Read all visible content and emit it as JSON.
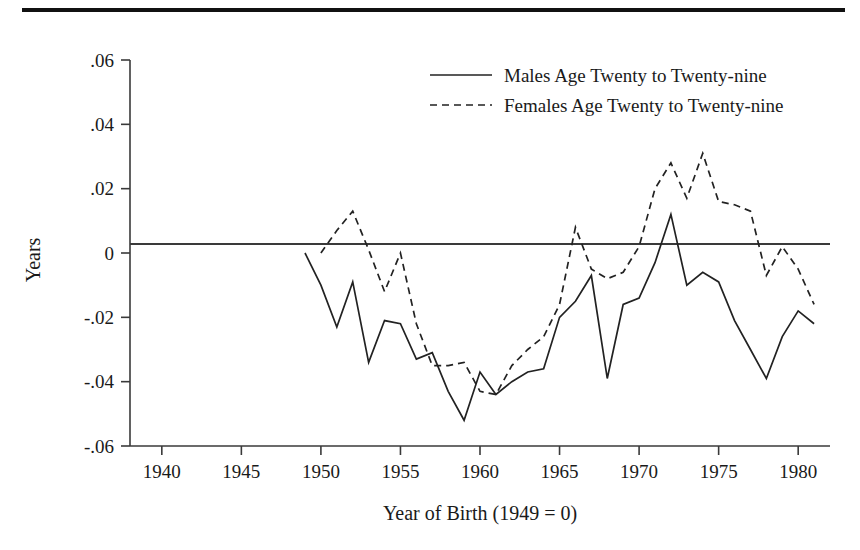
{
  "figure": {
    "rule_present": true,
    "ylabel": "Years",
    "xlabel": "Year of Birth (1949 = 0)"
  },
  "legend": {
    "entries": [
      {
        "label": "Males Age Twenty to Twenty-nine",
        "style": "solid"
      },
      {
        "label": "Females Age Twenty to Twenty-nine",
        "style": "dashed"
      }
    ]
  },
  "axes": {
    "y_ticks": [
      ".06",
      ".04",
      ".02",
      "0",
      "-.02",
      "-.04",
      "-.06"
    ],
    "x_ticks": [
      "1940",
      "1945",
      "1950",
      "1955",
      "1960",
      "1965",
      "1970",
      "1975",
      "1980"
    ]
  },
  "chart_data": {
    "type": "line",
    "title": "",
    "xlabel": "Year of Birth (1949 = 0)",
    "ylabel": "Years",
    "xlim": [
      1938,
      1982
    ],
    "ylim": [
      -0.06,
      0.06
    ],
    "xticks": [
      1940,
      1945,
      1950,
      1955,
      1960,
      1965,
      1970,
      1975,
      1980
    ],
    "yticks": [
      -0.06,
      -0.04,
      -0.02,
      0,
      0.02,
      0.04,
      0.06
    ],
    "ytick_labels": [
      "-.06",
      "-.04",
      "-.02",
      "0",
      ".02",
      ".04",
      ".06"
    ],
    "grid": false,
    "legend_position": "top-right",
    "zero_reference_line": 0,
    "series": [
      {
        "name": "Males Age Twenty to Twenty-nine",
        "style": "solid",
        "x": [
          1949,
          1950,
          1951,
          1952,
          1953,
          1954,
          1955,
          1956,
          1957,
          1958,
          1959,
          1960,
          1961,
          1962,
          1963,
          1964,
          1965,
          1966,
          1967,
          1968,
          1969,
          1970,
          1971,
          1972,
          1973,
          1974,
          1975,
          1976,
          1977,
          1978,
          1979,
          1980,
          1981
        ],
        "y": [
          0.0,
          -0.01,
          -0.023,
          -0.009,
          -0.034,
          -0.021,
          -0.022,
          -0.033,
          -0.031,
          -0.043,
          -0.052,
          -0.037,
          -0.044,
          -0.04,
          -0.037,
          -0.036,
          -0.02,
          -0.015,
          -0.007,
          -0.039,
          -0.016,
          -0.014,
          -0.003,
          0.012,
          -0.01,
          -0.006,
          -0.009,
          -0.021,
          -0.03,
          -0.039,
          -0.026,
          -0.018,
          -0.022
        ]
      },
      {
        "name": "Females Age Twenty to Twenty-nine",
        "style": "dashed",
        "x": [
          1950,
          1951,
          1952,
          1953,
          1954,
          1955,
          1956,
          1957,
          1958,
          1959,
          1960,
          1961,
          1962,
          1963,
          1964,
          1965,
          1966,
          1967,
          1968,
          1969,
          1970,
          1971,
          1972,
          1973,
          1974,
          1975,
          1976,
          1977,
          1978,
          1979,
          1980,
          1981
        ],
        "y": [
          0.0,
          0.007,
          0.013,
          0.001,
          -0.012,
          0.0,
          -0.022,
          -0.035,
          -0.035,
          -0.034,
          -0.043,
          -0.044,
          -0.035,
          -0.03,
          -0.026,
          -0.016,
          0.008,
          -0.005,
          -0.008,
          -0.006,
          0.002,
          0.02,
          0.028,
          0.017,
          0.031,
          0.016,
          0.015,
          0.013,
          -0.007,
          0.002,
          -0.005,
          -0.016
        ]
      }
    ]
  }
}
